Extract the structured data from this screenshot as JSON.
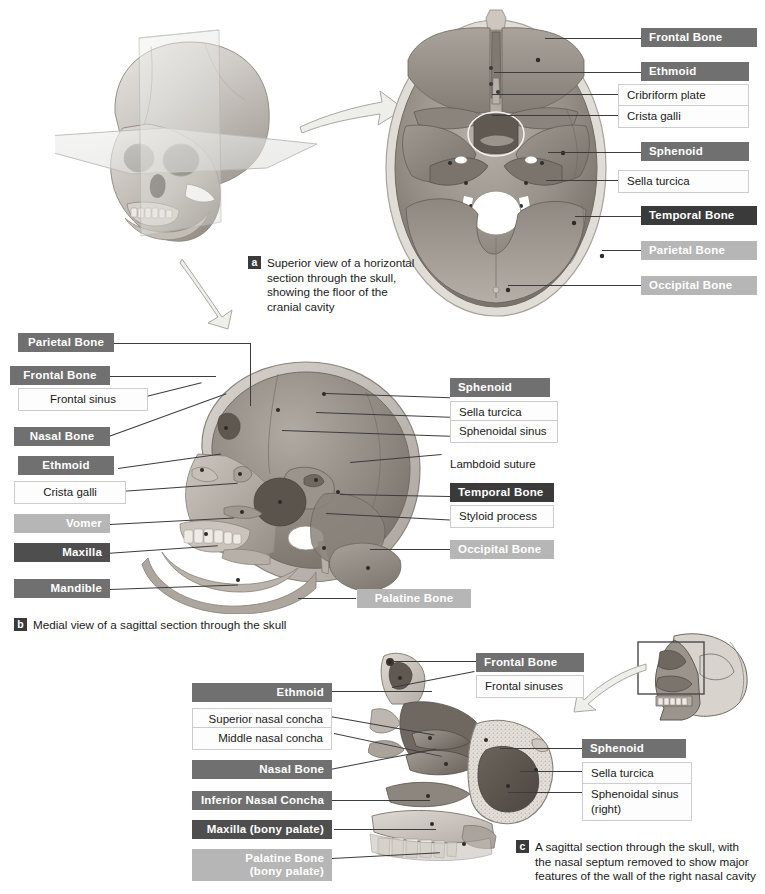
{
  "figure": {
    "background": "#ffffff",
    "colors": {
      "label_dark": "#4e4e4e",
      "label_mid": "#707070",
      "label_light": "#b6b6b6",
      "label_verydark": "#3a3a3a",
      "sublabel_bg": "#fdfdfd",
      "sublabel_border": "#cccccc",
      "leader_line": "#3c3c3c",
      "text_dark": "#1a1a1a",
      "text_light": "#ffffff"
    }
  },
  "panel_a": {
    "tag": "a",
    "caption": "Superior view of a horizontal section through the skull, showing the floor of the cranial cavity",
    "labels": [
      {
        "text": "Frontal  Bone",
        "style": "mid"
      },
      {
        "text": "Ethmoid",
        "style": "mid"
      },
      {
        "text": "Sphenoid",
        "style": "mid"
      },
      {
        "text": "Temporal Bone",
        "style": "verydark"
      },
      {
        "text": "Parietal Bone",
        "style": "light"
      },
      {
        "text": "Occipital Bone",
        "style": "light"
      }
    ],
    "sublabels": [
      {
        "text": "Cribriform plate"
      },
      {
        "text": "Crista galli"
      },
      {
        "text": "Sella turcica"
      }
    ]
  },
  "panel_b": {
    "tag": "b",
    "caption": "Medial view of a sagittal section through the skull",
    "left_labels": [
      {
        "text": "Parietal Bone",
        "style": "mid"
      },
      {
        "text": "Frontal  Bone",
        "style": "mid"
      },
      {
        "text": "Nasal Bone",
        "style": "mid"
      },
      {
        "text": "Ethmoid",
        "style": "mid"
      },
      {
        "text": "Vomer",
        "style": "light"
      },
      {
        "text": "Maxilla",
        "style": "dark"
      },
      {
        "text": "Mandible",
        "style": "mid"
      }
    ],
    "left_sublabels": [
      {
        "text": "Frontal sinus"
      },
      {
        "text": "Crista galli"
      }
    ],
    "right_labels": [
      {
        "text": "Sphenoid",
        "style": "mid"
      },
      {
        "text": "Temporal Bone",
        "style": "verydark"
      },
      {
        "text": "Occipital Bone",
        "style": "light"
      }
    ],
    "right_sublabels": [
      {
        "text": "Sella turcica"
      },
      {
        "text": "Sphenoidal sinus"
      },
      {
        "text": "Styloid process"
      }
    ],
    "plain_labels": [
      {
        "text": "Lambdoid suture"
      }
    ],
    "bottom_label": {
      "text": "Palatine Bone",
      "style": "light"
    }
  },
  "panel_c": {
    "tag": "c",
    "caption": "A sagittal section through the skull, with the nasal septum removed to show major features of the wall of the right nasal cavity",
    "left_labels": [
      {
        "text": "Ethmoid",
        "style": "mid"
      },
      {
        "text": "Nasal Bone",
        "style": "mid"
      },
      {
        "text": "Inferior Nasal Concha",
        "style": "mid"
      },
      {
        "text": "Maxilla (bony palate)",
        "style": "dark"
      },
      {
        "text": "Palatine Bone",
        "style": "light",
        "line2": "(bony palate)"
      }
    ],
    "left_sublabels": [
      {
        "text": "Superior nasal concha"
      },
      {
        "text": "Middle nasal concha"
      }
    ],
    "right_labels": [
      {
        "text": "Frontal  Bone",
        "style": "mid"
      },
      {
        "text": "Sphenoid",
        "style": "mid"
      }
    ],
    "right_sublabels": [
      {
        "text": "Frontal sinuses"
      },
      {
        "text": "Sella turcica"
      },
      {
        "text": "Sphenoidal sinus",
        "line2": "(right)"
      }
    ]
  },
  "icons": {
    "arrow_a": "curved-arrow-right-icon",
    "arrow_b": "curved-arrow-down-icon",
    "arrow_c": "curved-arrow-left-icon",
    "inset_skull": "skull-lateral-inset-icon",
    "inset_box": "region-highlight-box-icon"
  }
}
